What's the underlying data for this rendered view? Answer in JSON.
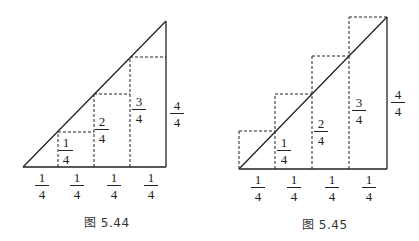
{
  "figures": [
    {
      "caption": "图 5.44",
      "type": "inscribed-rectangles-under-triangle",
      "base_labels": [
        {
          "num": "1",
          "den": "4"
        },
        {
          "num": "1",
          "den": "4"
        },
        {
          "num": "1",
          "den": "4"
        },
        {
          "num": "1",
          "den": "4"
        }
      ],
      "step_labels": [
        {
          "num": "1",
          "den": "4"
        },
        {
          "num": "2",
          "den": "4"
        },
        {
          "num": "3",
          "den": "4"
        }
      ],
      "height_label": {
        "num": "4",
        "den": "4"
      }
    },
    {
      "caption": "图 5.45",
      "type": "circumscribed-rectangles-over-triangle",
      "base_labels": [
        {
          "num": "1",
          "den": "4"
        },
        {
          "num": "1",
          "den": "4"
        },
        {
          "num": "1",
          "den": "4"
        },
        {
          "num": "1",
          "den": "4"
        }
      ],
      "step_labels": [
        {
          "num": "1",
          "den": "4"
        },
        {
          "num": "2",
          "den": "4"
        },
        {
          "num": "3",
          "den": "4"
        }
      ],
      "height_label": {
        "num": "4",
        "den": "4"
      }
    }
  ],
  "colors": {
    "line": "#222222",
    "background": "#ffffff"
  }
}
